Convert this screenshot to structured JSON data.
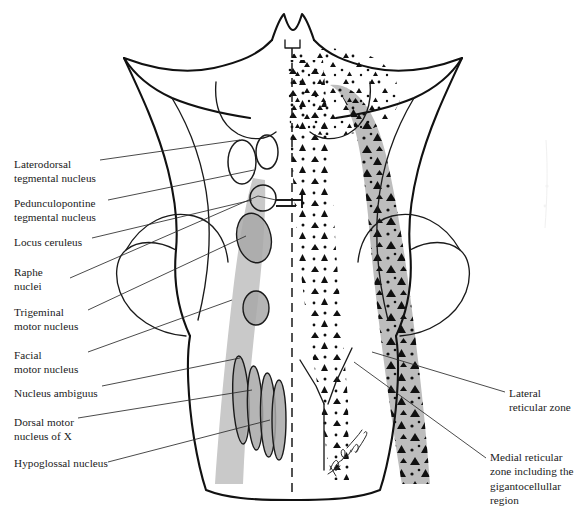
{
  "figure": {
    "signature": "artist-signature",
    "colors": {
      "ink": "#111111",
      "leader": "#2b2b2b",
      "gray_column": "#c9c9c9",
      "gray_column_dark": "#bdbdbd",
      "nucleus_fill": "#a8a8a8",
      "background": "#ffffff"
    }
  },
  "labels": {
    "left": [
      {
        "id": "laterodorsal-tegmental-nucleus",
        "text": "Laterodorsal\ntegmental nucleus",
        "x": 14,
        "y": 157
      },
      {
        "id": "pedunculopontine-tegmental-nucleus",
        "text": "Pedunculopontine\ntegmental nucleus",
        "x": 14,
        "y": 196
      },
      {
        "id": "locus-ceruleus",
        "text": "Locus ceruleus",
        "x": 14,
        "y": 235
      },
      {
        "id": "raphe-nuclei",
        "text": "Raphe\nnuclei",
        "x": 14,
        "y": 265
      },
      {
        "id": "trigeminal-motor-nucleus",
        "text": "Trigeminal\nmotor nucleus",
        "x": 14,
        "y": 305
      },
      {
        "id": "facial-motor-nucleus",
        "text": "Facial\nmotor nucleus",
        "x": 14,
        "y": 348
      },
      {
        "id": "nucleus-ambiguus",
        "text": "Nucleus ambiguus",
        "x": 14,
        "y": 386
      },
      {
        "id": "dorsal-motor-nucleus-of-x",
        "text": "Dorsal motor\nnucleus of X",
        "x": 14,
        "y": 415
      },
      {
        "id": "hypoglossal-nucleus",
        "text": "Hypoglossal nucleus",
        "x": 14,
        "y": 456
      }
    ],
    "right": [
      {
        "id": "lateral-reticular-zone",
        "text": "Lateral\nreticular zone",
        "x": 509,
        "y": 386
      },
      {
        "id": "medial-reticular-zone",
        "text": "Medial reticular\nzone including the\ngigantocellullar\nregion",
        "x": 490,
        "y": 450
      }
    ]
  }
}
